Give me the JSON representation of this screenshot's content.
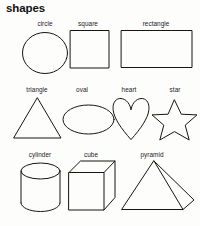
{
  "page": {
    "title": "shapes",
    "background_color": "#fdfdfc",
    "ink_color": "#17150f"
  },
  "rows": [
    {
      "name": "row-1",
      "items": [
        {
          "label": "circle",
          "icon": "circle-shape"
        },
        {
          "label": "square",
          "icon": "square-shape"
        },
        {
          "label": "rectangle",
          "icon": "rectangle-shape"
        }
      ]
    },
    {
      "name": "row-2",
      "items": [
        {
          "label": "triangle",
          "icon": "triangle-shape"
        },
        {
          "label": "oval",
          "icon": "oval-shape"
        },
        {
          "label": "heart",
          "icon": "heart-shape"
        },
        {
          "label": "star",
          "icon": "star-shape"
        }
      ]
    },
    {
      "name": "row-3",
      "items": [
        {
          "label": "cylinder",
          "icon": "cylinder-shape"
        },
        {
          "label": "cube",
          "icon": "cube-shape"
        },
        {
          "label": "pyramid",
          "icon": "pyramid-shape"
        }
      ]
    }
  ]
}
